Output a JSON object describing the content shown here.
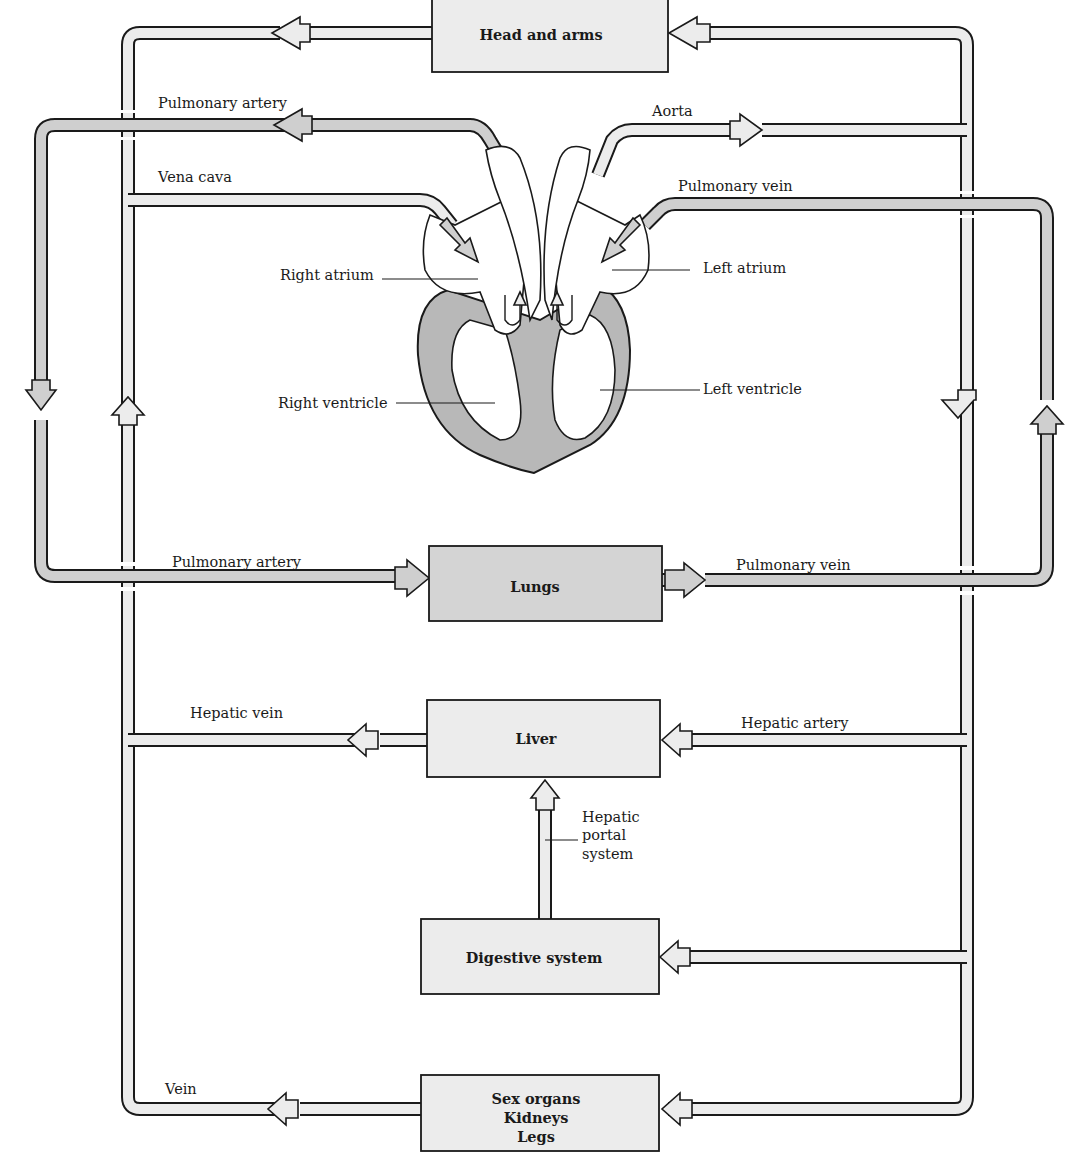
{
  "diagram": {
    "type": "circulatory-system-flowchart",
    "colors": {
      "oxygenated_vessel": "#ececec",
      "deoxygenated_vessel": "#cfcfcf",
      "heart_muscle": "#b8b8b8",
      "organ_box": "#ececec",
      "lungs_box": "#d4d4d4",
      "outline": "#1a1a1a"
    },
    "organs": {
      "head_and_arms": "Head and arms",
      "lungs": "Lungs",
      "liver": "Liver",
      "digestive_system": "Digestive system",
      "lower_body": [
        "Sex organs",
        "Kidneys",
        "Legs"
      ]
    },
    "vessels": {
      "pulmonary_artery_top": "Pulmonary artery",
      "aorta": "Aorta",
      "vena_cava": "Vena cava",
      "pulmonary_vein_top": "Pulmonary vein",
      "pulmonary_artery_bottom": "Pulmonary artery",
      "pulmonary_vein_bottom": "Pulmonary vein",
      "hepatic_vein": "Hepatic vein",
      "hepatic_artery": "Hepatic artery",
      "hepatic_portal": [
        "Hepatic",
        "portal",
        "system"
      ],
      "vein": "Vein"
    },
    "heart": {
      "right_atrium": "Right atrium",
      "left_atrium": "Left atrium",
      "right_ventricle": "Right ventricle",
      "left_ventricle": "Left ventricle"
    }
  }
}
